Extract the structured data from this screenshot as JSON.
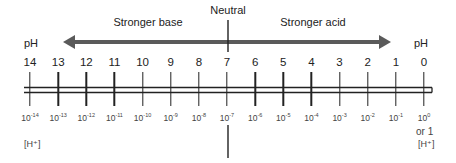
{
  "diagram": {
    "neutral_label": "Neutral",
    "base_label": "Stronger base",
    "acid_label": "Stronger acid",
    "ph_axis_label_left": "pH",
    "ph_axis_label_right": "pH",
    "h_axis_label_left": "[H⁺]",
    "h_axis_label_right": "[H⁺]",
    "h_zero_extra": "or 1",
    "colors": {
      "arrow": "#5a5a5a",
      "line": "#222222",
      "text": "#222222"
    },
    "scale": [
      {
        "ph": "14",
        "h_base": "10",
        "h_exp": "-14"
      },
      {
        "ph": "13",
        "h_base": "10",
        "h_exp": "-13"
      },
      {
        "ph": "12",
        "h_base": "10",
        "h_exp": "-12"
      },
      {
        "ph": "11",
        "h_base": "10",
        "h_exp": "-11"
      },
      {
        "ph": "10",
        "h_base": "10",
        "h_exp": "-10"
      },
      {
        "ph": "9",
        "h_base": "10",
        "h_exp": "-9"
      },
      {
        "ph": "8",
        "h_base": "10",
        "h_exp": "-8"
      },
      {
        "ph": "7",
        "h_base": "10",
        "h_exp": "-7"
      },
      {
        "ph": "6",
        "h_base": "10",
        "h_exp": "-6"
      },
      {
        "ph": "5",
        "h_base": "10",
        "h_exp": "-5"
      },
      {
        "ph": "4",
        "h_base": "10",
        "h_exp": "-4"
      },
      {
        "ph": "3",
        "h_base": "10",
        "h_exp": "-3"
      },
      {
        "ph": "2",
        "h_base": "10",
        "h_exp": "-2"
      },
      {
        "ph": "1",
        "h_base": "10",
        "h_exp": "-1"
      },
      {
        "ph": "0",
        "h_base": "10",
        "h_exp": "0"
      }
    ]
  }
}
